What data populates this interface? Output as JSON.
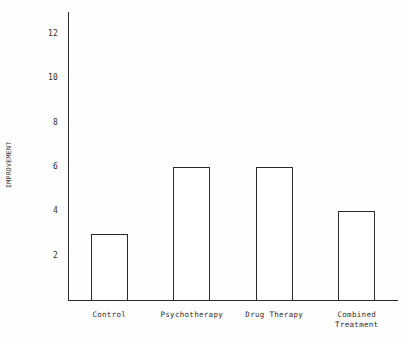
{
  "chart_data": {
    "type": "bar",
    "title": "",
    "subtitle": "",
    "xlabel": "",
    "ylabel": "IMPROVEMENT",
    "categories": [
      "Control",
      "Psychotherapy",
      "Drug Therapy",
      "Combined\nTreatment"
    ],
    "values": [
      3,
      6,
      6,
      4
    ],
    "ylim": [
      0,
      13
    ],
    "yticks": [
      2,
      4,
      6,
      8,
      10,
      12
    ],
    "ytick_labels": [
      "2",
      "4",
      "6",
      "8",
      "10",
      "12"
    ],
    "grid": false,
    "legend": false,
    "legend_position": "none",
    "bar_fill": "#ffffff",
    "bar_edge_color": "#2b2b2b",
    "axis_color": "#2b2b2b",
    "background": "#fefefe",
    "annotations": []
  },
  "figure": {
    "axis_title_y": "IMPROVEMENT"
  }
}
